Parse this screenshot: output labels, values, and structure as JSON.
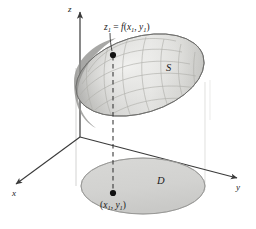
{
  "figure": {
    "background_color": "#ffffff",
    "axes": {
      "z_label": "z",
      "x_label": "x",
      "y_label": "y",
      "stroke_color": "#3a3a3a"
    },
    "labels": {
      "surface_name": "S",
      "domain_name": "D",
      "height_expression_lead": "z",
      "height_expression_sub1": "1",
      "height_expression_eq": " = ",
      "height_expression_fn": "f",
      "height_expression_open": "(",
      "height_expression_x": "x",
      "height_expression_xsub": "1",
      "height_expression_comma": ", ",
      "height_expression_y": "y",
      "height_expression_ysub": "1",
      "height_expression_close": ")",
      "height_expression_full": "z1 = f(x1, y1)",
      "point_label_open": "(",
      "point_label_x": "x",
      "point_label_xsub": "1",
      "point_label_comma": ", ",
      "point_label_y": "y",
      "point_label_ysub": "1",
      "point_label_close": ")",
      "point_label_full": "(x1, y1)"
    },
    "colors": {
      "surface_fill_light": "#e4e4e2",
      "surface_fill_mid": "#cfcfcd",
      "surface_edge_dark": "#8e8e8c",
      "domain_fill": "#d3d3d1",
      "domain_stroke": "#8a8a88",
      "mesh_stroke": "#b4b4b0",
      "axis_stroke": "#3a3a3a",
      "dashed_line": "#3a3a3a",
      "cylinder_line": "#c6c6c4",
      "dot_fill": "#111111"
    },
    "geometry": {
      "origin_x": 80,
      "origin_y": 137,
      "surface_center_x": 140,
      "surface_center_y": 75,
      "domain_center_x": 143,
      "domain_center_y": 186,
      "point_upper_x": 113,
      "point_upper_y": 55,
      "point_lower_x": 113,
      "point_lower_y": 193
    }
  }
}
